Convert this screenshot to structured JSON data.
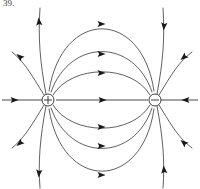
{
  "figure": {
    "label": "39.",
    "title": "Electric dipole field lines",
    "background_color": "#ffffff",
    "line_color": "#2b2b2b",
    "axis_color": "#4a4a4a",
    "arrow_color": "#1a1a1a"
  },
  "charges": [
    {
      "id": "positive-charge",
      "glyph": "+",
      "sign": "positive",
      "cx": 48,
      "cy": 100,
      "r": 6
    },
    {
      "id": "negative-charge",
      "glyph": "−",
      "sign": "negative",
      "cx": 155,
      "cy": 100,
      "r": 6
    }
  ],
  "chart_data": {
    "type": "diagram",
    "title": "Electric dipole field lines",
    "xlabel": "",
    "ylabel": "",
    "source_charge": {
      "glyph": "+",
      "x": 48,
      "y": 100
    },
    "sink_charge": {
      "glyph": "−",
      "x": 155,
      "y": 100
    },
    "field_line_count": 16,
    "arrow_count": 16,
    "symmetry": "mirror symmetric about the horizontal axis y = 100",
    "flow_direction": "positive to negative (left to right)"
  },
  "lines": {
    "axis_middle": {
      "name": "axis-between-charges",
      "d": "M 56 100 L 148 100"
    },
    "axis_left": {
      "name": "axis-left-outer",
      "d": "M 42 100 L 2 100"
    },
    "axis_right": {
      "name": "axis-right-outer",
      "d": "M 161 100 L 198 100"
    },
    "connecting": [
      {
        "name": "arc-upper-1",
        "d": "M 53 95 C 72 64 132 64 150 95"
      },
      {
        "name": "arc-upper-2",
        "d": "M 51 92 C 70 38 134 38 152 92"
      },
      {
        "name": "arc-upper-3",
        "d": "M 49 91 C 62 8 142 8 154 91"
      },
      {
        "name": "arc-lower-1",
        "d": "M 53 105 C 72 136 132 136 150 105"
      },
      {
        "name": "arc-lower-2",
        "d": "M 51 108 C 70 162 134 162 152 108"
      },
      {
        "name": "arc-lower-3",
        "d": "M 49 109 C 62 192 142 192 154 109"
      }
    ],
    "outer": [
      {
        "name": "outer-upper-left-steep",
        "d": "M 46 94 C 40 62 38 38 40 8"
      },
      {
        "name": "outer-upper-left-mid",
        "d": "M 44 95 C 30 72 24 62 12 52"
      },
      {
        "name": "outer-lower-left-steep",
        "d": "M 46 106 C 40 138 38 162 40 188"
      },
      {
        "name": "outer-lower-left-mid",
        "d": "M 44 105 C 30 128 24 138 12 148"
      },
      {
        "name": "outer-upper-right-steep",
        "d": "M 157 94 C 163 62 165 38 163 8"
      },
      {
        "name": "outer-upper-right-mid",
        "d": "M 159 95 C 173 72 179 62 192 52"
      },
      {
        "name": "outer-lower-right-steep",
        "d": "M 157 106 C 163 138 165 162 163 188"
      },
      {
        "name": "outer-lower-right-mid",
        "d": "M 159 105 C 173 128 179 138 192 148"
      }
    ]
  },
  "arrows": [
    {
      "name": "arrow-axis-middle",
      "x": 102,
      "y": 100,
      "angle": 0
    },
    {
      "name": "arrow-axis-left",
      "x": 14,
      "y": 100,
      "angle": 0
    },
    {
      "name": "arrow-axis-right",
      "x": 186,
      "y": 100,
      "angle": 180
    },
    {
      "name": "arrow-arc-upper-1",
      "x": 101,
      "y": 73,
      "angle": 0
    },
    {
      "name": "arrow-arc-upper-2",
      "x": 101,
      "y": 54,
      "angle": 0
    },
    {
      "name": "arrow-arc-upper-3",
      "x": 101,
      "y": 24,
      "angle": 0
    },
    {
      "name": "arrow-arc-lower-1",
      "x": 101,
      "y": 127,
      "angle": 0
    },
    {
      "name": "arrow-arc-lower-2",
      "x": 101,
      "y": 146,
      "angle": 0
    },
    {
      "name": "arrow-arc-lower-3",
      "x": 101,
      "y": 175,
      "angle": 0
    },
    {
      "name": "arrow-outer-upper-left-steep",
      "x": 39,
      "y": 22,
      "angle": 265
    },
    {
      "name": "arrow-outer-upper-left-mid",
      "x": 20,
      "y": 57,
      "angle": 219
    },
    {
      "name": "arrow-outer-lower-left-steep",
      "x": 39,
      "y": 173,
      "angle": 95
    },
    {
      "name": "arrow-outer-lower-left-mid",
      "x": 20,
      "y": 143,
      "angle": 141
    },
    {
      "name": "arrow-outer-upper-right-steep",
      "x": 164,
      "y": 26,
      "angle": 95
    },
    {
      "name": "arrow-outer-upper-right-mid",
      "x": 184,
      "y": 57,
      "angle": 140
    },
    {
      "name": "arrow-outer-lower-right-steep",
      "x": 164,
      "y": 170,
      "angle": 265
    },
    {
      "name": "arrow-outer-lower-right-mid",
      "x": 184,
      "y": 143,
      "angle": 220
    }
  ]
}
